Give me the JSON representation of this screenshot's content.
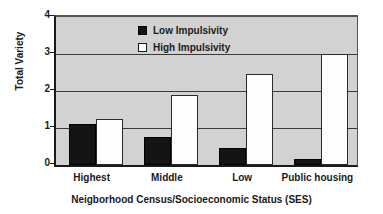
{
  "chart_data": {
    "type": "bar",
    "title": "",
    "subtitle": "",
    "xlabel": "Neigborhood Census/Socioeconomic Status (SES)",
    "ylabel": "Total Variety",
    "categories": [
      "Highest",
      "Middle",
      "Low",
      "Public housing"
    ],
    "series": [
      {
        "name": "Low Impulsivity",
        "color": "#141414",
        "values": [
          1.1,
          0.77,
          0.47,
          0.15
        ]
      },
      {
        "name": "High Impulsivity",
        "color": "#ffffff",
        "values": [
          1.25,
          1.88,
          2.45,
          3.0
        ]
      }
    ],
    "ylim": [
      0,
      4
    ],
    "yticks": [
      0,
      1,
      2,
      3,
      4
    ],
    "ytick_labels": [
      "0",
      "1",
      "2",
      "3",
      "4"
    ],
    "grid": true,
    "grid_axis": "y",
    "legend_position": "top-center-inside",
    "plot_background": "#d2d2d2",
    "figure_background": "#ffffff",
    "axis_color": "#1a1a1a",
    "gridline_color": "#3a3a3a"
  }
}
